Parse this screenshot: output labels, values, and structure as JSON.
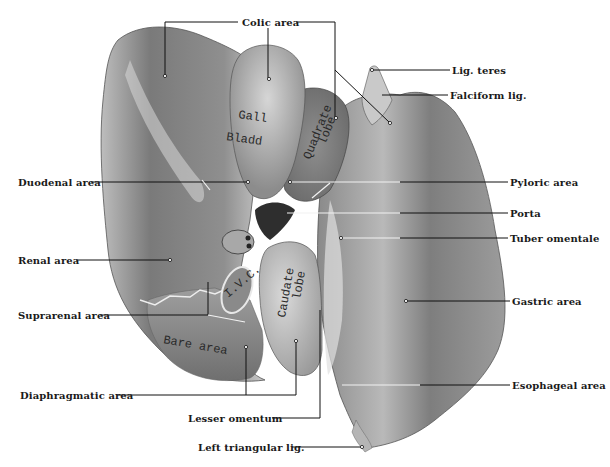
{
  "figure": {
    "labels": {
      "colic_area": "Colic area",
      "lig_teres": "Lig. teres",
      "falciform_lig": "Falciform lig.",
      "duodenal_area": "Duodenal area",
      "pyloric_area": "Pyloric area",
      "porta": "Porta",
      "tuber_omentale": "Tuber omentale",
      "renal_area": "Renal area",
      "gastric_area": "Gastric area",
      "suprarenal_area": "Suprarenal area",
      "diaphragmatic_area": "Diaphragmatic area",
      "esophageal_area": "Esophageal area",
      "lesser_omentum": "Lesser omentum",
      "left_triangular_lig": "Left triangular lig."
    },
    "organ_text": {
      "gall": "Gall",
      "bladder": "Bladd",
      "quadrate": "Quadrate",
      "lobe_q": "lobe",
      "caudate": "Caudate",
      "lobe_c": "lobe",
      "bare_area": "Bare area",
      "ivc": "I.V.C."
    },
    "colors": {
      "background": "#ffffff",
      "tissue_dark": "#6e6e6e",
      "tissue_mid": "#9a9a9a",
      "tissue_light": "#d4d4d4",
      "line": "#111111"
    }
  }
}
